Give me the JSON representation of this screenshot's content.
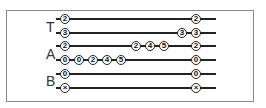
{
  "groups": [
    {
      "label": "T",
      "x": 46,
      "y": 20
    },
    {
      "label": "A",
      "x": 46,
      "y": 47
    },
    {
      "label": "B",
      "x": 46,
      "y": 74
    }
  ],
  "rows": [
    {
      "y": 19,
      "line_start": 56,
      "line_end": 216,
      "circles": [
        {
          "x": 65,
          "text": "2"
        },
        {
          "x": 196,
          "text": "2"
        }
      ]
    },
    {
      "y": 33,
      "line_start": 56,
      "line_end": 216,
      "circles": [
        {
          "x": 65,
          "text": "3"
        },
        {
          "x": 182,
          "text": "3"
        },
        {
          "x": 196,
          "text": "3"
        }
      ]
    },
    {
      "y": 46,
      "line_start": 56,
      "line_end": 216,
      "circles": [
        {
          "x": 65,
          "text": "2"
        },
        {
          "x": 136,
          "text": "2"
        },
        {
          "x": 150,
          "text": "4"
        },
        {
          "x": 164,
          "text": "5"
        },
        {
          "x": 196,
          "text": "2"
        }
      ]
    },
    {
      "y": 60,
      "line_start": 56,
      "line_end": 216,
      "circles": [
        {
          "x": 65,
          "text": "0"
        },
        {
          "x": 79,
          "text": "0"
        },
        {
          "x": 93,
          "text": "2"
        },
        {
          "x": 107,
          "text": "4"
        },
        {
          "x": 121,
          "text": "5"
        },
        {
          "x": 196,
          "text": "0"
        }
      ]
    },
    {
      "y": 74,
      "line_start": 56,
      "line_end": 216,
      "circles": [
        {
          "x": 65,
          "text": "0"
        },
        {
          "x": 196,
          "text": "0"
        }
      ]
    },
    {
      "y": 88,
      "line_start": 56,
      "line_end": 216,
      "circles": [
        {
          "x": 65,
          "text": "×"
        },
        {
          "x": 196,
          "text": "×"
        }
      ]
    }
  ]
}
